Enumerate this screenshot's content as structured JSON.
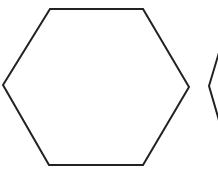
{
  "diagram": {
    "background": "#ffffff",
    "stroke_color": "#222222",
    "shapes": [
      {
        "type": "hexagon",
        "points": "50,9 143,9 189,87 143,165 49,165 3,85"
      },
      {
        "type": "hexagon-partial",
        "points": "240,9 232,9 209,86 232,165 240,165"
      }
    ]
  }
}
